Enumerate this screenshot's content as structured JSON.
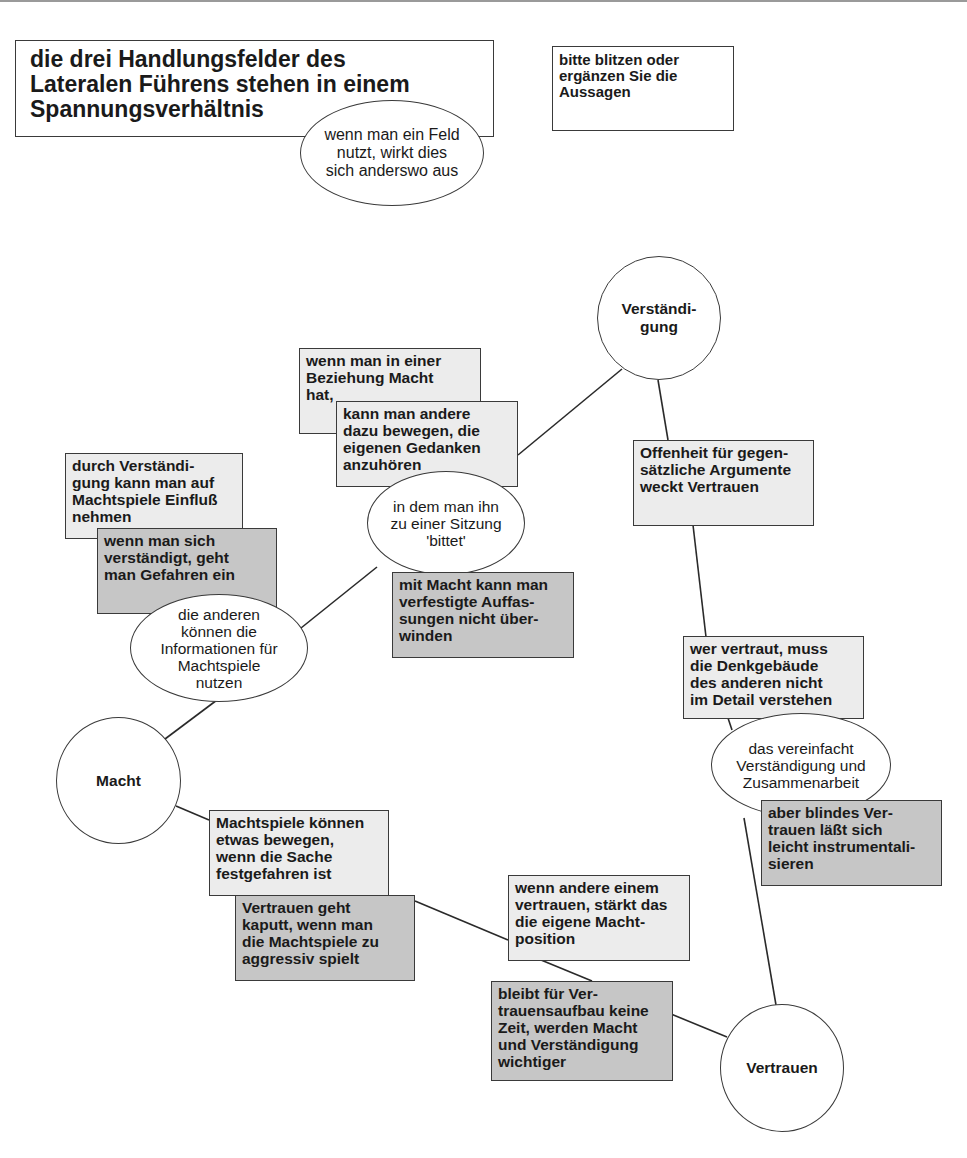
{
  "header": {
    "title": "die drei Handlungsfelder des\nLateralen Führens stehen in einem\nSpannungsverhältnis",
    "title_bubble": "wenn man ein Feld\nnutzt, wirkt dies\nsich anderswo aus",
    "instruction": "bitte blitzen oder\nergänzen Sie die\nAussagen"
  },
  "nodes": {
    "verstaendigung": "Verständi-\ngung",
    "macht": "Macht",
    "vertrauen": "Vertrauen"
  },
  "statements": {
    "macht_beziehung": "wenn man in einer\nBeziehung Macht\nhat,",
    "andere_bewegen": "kann man andere\ndazu bewegen, die\neigenen Gedanken\nanzuhören",
    "sitzung_bubble": "in dem man ihn\nzu einer Sitzung\n'bittet'",
    "verfestigte_auffassungen": "mit Macht kann man\nverfestigte Auffas-\nsungen nicht über-\nwinden",
    "durch_verstaendigung": "durch Verständi-\ngung kann man auf\nMachtspiele Einfluß\nnehmen",
    "gefahren": "wenn man sich\nverständigt, geht\nman Gefahren ein",
    "informationen_bubble": "die anderen\nkönnen die\nInformationen für\nMachtspiele\nnutzen",
    "offenheit": "Offenheit für gegen-\nsätzliche Argumente\nweckt Vertrauen",
    "wer_vertraut": "wer vertraut, muss\ndie Denkgebäude\ndes anderen nicht\nim Detail verstehen",
    "vereinfacht_bubble": "das vereinfacht\nVerständigung und\nZusammenarbeit",
    "blindes_vertrauen": "aber blindes Ver-\ntrauen läßt sich\nleicht instrumentali-\nsieren",
    "machtspiele_bewegen": "Machtspiele können\netwas bewegen,\nwenn die Sache\nfestgefahren ist",
    "vertrauen_kaputt": "Vertrauen geht\nkaputt, wenn man\ndie Machtspiele zu\naggressiv spielt",
    "andere_vertrauen": "wenn andere einem\nvertrauen, stärkt das\ndie eigene Macht-\nposition",
    "keine_zeit": "bleibt für Ver-\ntrauensaufbau keine\nZeit, werden Macht\nund Verständigung\nwichtiger"
  },
  "colors": {
    "light_box": "#ececec",
    "dark_box": "#c6c6c6",
    "border": "#3a3a3a"
  }
}
